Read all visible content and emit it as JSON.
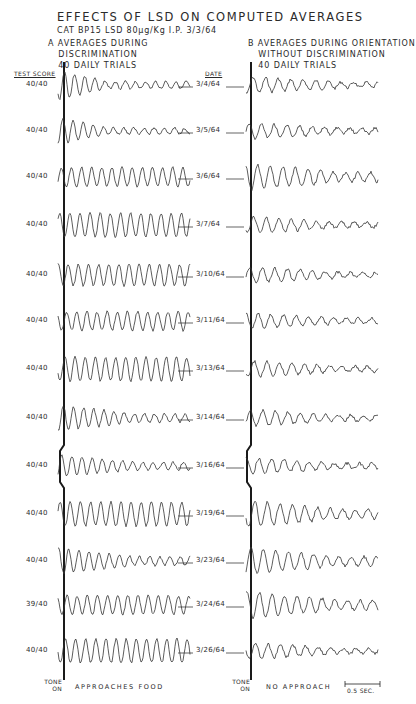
{
  "figure": {
    "title": "EFFECTS OF LSD ON COMPUTED AVERAGES",
    "subtitle": "CAT BP15   LSD 80μg/Kg I.P.   3/3/64",
    "panel_a": {
      "label": "A",
      "lines": [
        "AVERAGES DURING",
        "DISCRIMINATION",
        "40 DAILY TRIALS"
      ],
      "footer": "APPROACHES   FOOD"
    },
    "panel_b": {
      "label": "B",
      "lines": [
        "AVERAGES DURING ORIENTATION",
        "WITHOUT DISCRIMINATION",
        "40 DAILY TRIALS"
      ],
      "footer": "NO   APPROACH"
    },
    "column_headers": {
      "test_score": "TEST SCORE",
      "date": "DATE"
    },
    "tone_on": {
      "line1": "TONE",
      "line2": "ON"
    },
    "scale_bar": "0.5 SEC.",
    "rows": [
      {
        "score": "40/40",
        "date": "3/4/64",
        "y": 85
      },
      {
        "score": "40/40",
        "date": "3/5/64",
        "y": 131
      },
      {
        "score": "40/40",
        "date": "3/6/64",
        "y": 177
      },
      {
        "score": "40/40",
        "date": "3/7/64",
        "y": 225
      },
      {
        "score": "40/40",
        "date": "3/10/64",
        "y": 275
      },
      {
        "score": "40/40",
        "date": "3/11/64",
        "y": 321
      },
      {
        "score": "40/40",
        "date": "3/13/64",
        "y": 369
      },
      {
        "score": "40/40",
        "date": "3/14/64",
        "y": 418
      },
      {
        "score": "40/40",
        "date": "3/16/64",
        "y": 466
      },
      {
        "score": "40/40",
        "date": "3/19/64",
        "y": 514
      },
      {
        "score": "40/40",
        "date": "3/23/64",
        "y": 561
      },
      {
        "score": "39/40",
        "date": "3/24/64",
        "y": 605
      },
      {
        "score": "40/40",
        "date": "3/26/64",
        "y": 651
      }
    ]
  }
}
